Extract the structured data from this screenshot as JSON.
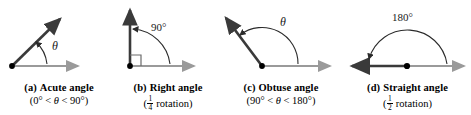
{
  "figure": {
    "background": "#ffffff",
    "ray_color_primary": "#3a3a3a",
    "ray_color_secondary": "#9a9a9a",
    "arc_color": "#2b2b2b",
    "vertex_color": "#000000"
  },
  "panels": [
    {
      "tag": "(a)",
      "title": "Acute angle",
      "subtitle_parts": {
        "prefix": "(0° < ",
        "symbol": "θ",
        "suffix": " < 90°)"
      },
      "angle_label": "θ",
      "angle_degrees": 45,
      "arc_sweep_label": "0 to 90 degrees",
      "has_right_angle_marker": false,
      "initial_ray": "horizontal-right",
      "terminal_ray": "up-right"
    },
    {
      "tag": "(b)",
      "title": "Right angle",
      "subtitle_parts": {
        "prefix": "(",
        "fraction_num": "1",
        "fraction_den": "4",
        "suffix": " rotation)"
      },
      "angle_label": "90°",
      "angle_degrees": 90,
      "has_right_angle_marker": true,
      "initial_ray": "horizontal-right",
      "terminal_ray": "vertical-up"
    },
    {
      "tag": "(c)",
      "title": "Obtuse angle",
      "subtitle_parts": {
        "prefix": "(90° < ",
        "symbol": "θ",
        "suffix": " < 180°)"
      },
      "angle_label": "θ",
      "angle_degrees": 135,
      "has_right_angle_marker": false,
      "initial_ray": "horizontal-right",
      "terminal_ray": "up-left"
    },
    {
      "tag": "(d)",
      "title": "Straight angle",
      "subtitle_parts": {
        "prefix": "(",
        "fraction_num": "1",
        "fraction_den": "2",
        "suffix": " rotation)"
      },
      "angle_label": "180°",
      "angle_degrees": 180,
      "has_right_angle_marker": false,
      "initial_ray": "horizontal-right",
      "terminal_ray": "horizontal-left"
    }
  ]
}
